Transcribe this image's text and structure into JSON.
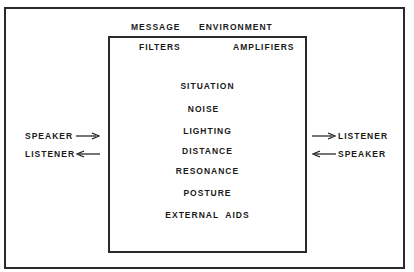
{
  "header": {
    "message": "MESSAGE",
    "environment": "ENVIRONMENT"
  },
  "box": {
    "filters": "FILTERS",
    "amplifiers": "AMPLIFIERS",
    "factors": [
      "SITUATION",
      "NOISE",
      "LIGHTING",
      "DISTANCE",
      "RESONANCE",
      "POSTURE",
      "EXTERNAL  AIDS"
    ]
  },
  "left": {
    "top_label": "SPEAKER",
    "top_arrow": "right-arrow",
    "bottom_label": "LISTENER",
    "bottom_arrow": "left-arrow"
  },
  "right": {
    "top_label": "LISTENER",
    "top_arrow": "right-arrow",
    "bottom_label": "SPEAKER",
    "bottom_arrow": "left-arrow"
  },
  "colors": {
    "ink": "#1a1a1a",
    "background": "#ffffff"
  }
}
